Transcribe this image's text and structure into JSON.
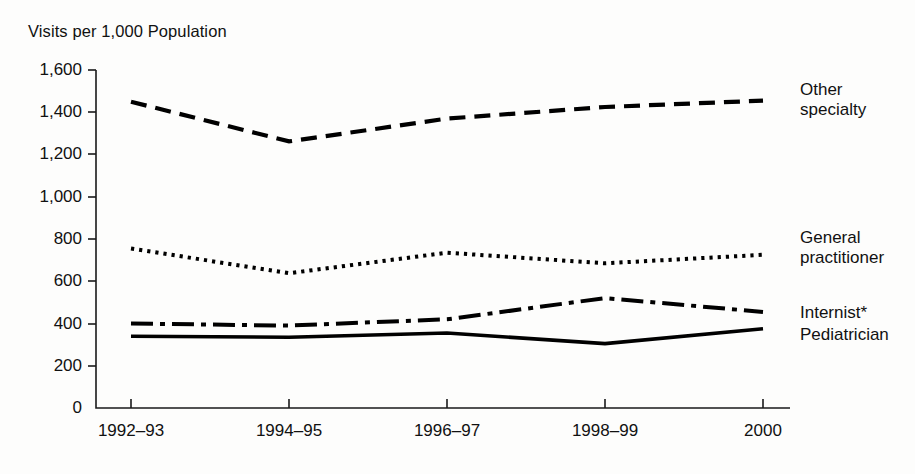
{
  "chart_data": {
    "type": "line",
    "title": "Visits per 1,000 Population",
    "xlabel": "",
    "ylabel": "Visits per 1,000 Population",
    "x": [
      "1992-93",
      "1994-95",
      "1996-97",
      "1998-99",
      "2000"
    ],
    "categories": [
      "1992–93",
      "1994–95",
      "1996–97",
      "1998–99",
      "2000"
    ],
    "ylim": [
      0,
      1600
    ],
    "yticks": [
      0,
      200,
      400,
      600,
      800,
      1000,
      1200,
      1400,
      1600
    ],
    "ytick_labels": [
      "0",
      "200",
      "400",
      "600",
      "800",
      "1,000",
      "1,200",
      "1,400",
      "1,600"
    ],
    "grid": false,
    "legend_position": "right-inline",
    "series": [
      {
        "name": "Other specialty",
        "label_lines": [
          "Other",
          "specialty"
        ],
        "style": "dashed",
        "values": [
          1450,
          1262,
          1370,
          1425,
          1455
        ]
      },
      {
        "name": "General practitioner",
        "label_lines": [
          "General",
          "practitioner"
        ],
        "style": "dotted",
        "values": [
          755,
          638,
          735,
          685,
          725
        ]
      },
      {
        "name": "Internist*",
        "label_lines": [
          "Internist*"
        ],
        "style": "dash-dot",
        "values": [
          400,
          390,
          420,
          520,
          455
        ]
      },
      {
        "name": "Pediatrician",
        "label_lines": [
          "Pediatrician"
        ],
        "style": "solid",
        "values": [
          340,
          335,
          355,
          305,
          375
        ]
      }
    ]
  },
  "axis": {
    "title": "Visits per 1,000 Population"
  },
  "xticks": [
    {
      "label": "1992–93"
    },
    {
      "label": "1994–95"
    },
    {
      "label": "1996–97"
    },
    {
      "label": "1998–99"
    },
    {
      "label": "2000"
    }
  ],
  "yticks": [
    {
      "label": "1,600"
    },
    {
      "label": "1,400"
    },
    {
      "label": "1,200"
    },
    {
      "label": "1,000"
    },
    {
      "label": "800"
    },
    {
      "label": "600"
    },
    {
      "label": "400"
    },
    {
      "label": "200"
    },
    {
      "label": "0"
    }
  ],
  "series_labels": {
    "other_specialty_line1": "Other",
    "other_specialty_line2": "specialty",
    "general_practitioner_line1": "General",
    "general_practitioner_line2": "practitioner",
    "internist": "Internist*",
    "pediatrician": "Pediatrician"
  },
  "colors": {
    "ink": "#000000",
    "background": "#fdfdfc"
  }
}
